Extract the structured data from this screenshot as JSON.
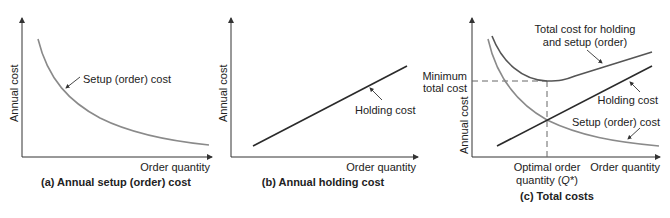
{
  "panels": [
    {
      "caption": "(a) Annual setup (order) cost",
      "ylabel": "Annual cost",
      "xlabel": "Order quantity",
      "curve_label": "Setup (order) cost"
    },
    {
      "caption": "(b) Annual holding cost",
      "ylabel": "Annual cost",
      "xlabel": "Order quantity",
      "line_label": "Holding cost"
    },
    {
      "caption": "(c) Total costs",
      "ylabel": "Annual cost",
      "xlabel": "Order quantity",
      "total_label_line1": "Total cost for holding",
      "total_label_line2": "and setup (order)",
      "holding_label": "Holding cost",
      "setup_label": "Setup (order) cost",
      "min_label_line1": "Minimum",
      "min_label_line2": "total cost",
      "opt_label_line1": "Optimal order",
      "opt_label_line2_pre": "quantity (",
      "opt_label_q": "Q",
      "opt_label_line2_post": "*)"
    }
  ],
  "colors": {
    "axis": "#333333",
    "setup_curve": "#8a8a8a",
    "holding_line": "#2a2a2a",
    "total_curve": "#555555",
    "dashed": "#666666"
  }
}
